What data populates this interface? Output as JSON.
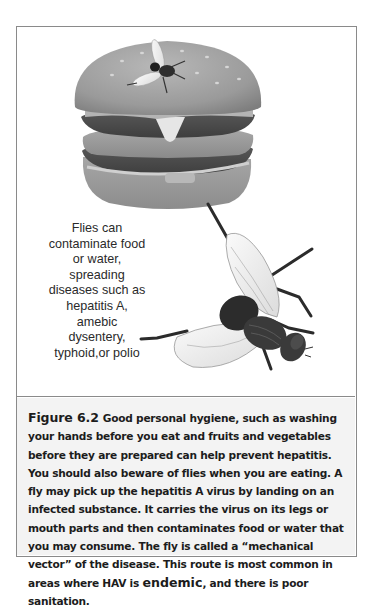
{
  "figure": {
    "label": "Figure 6.2",
    "illustration": {
      "subjects": [
        "hamburger-with-fly",
        "housefly"
      ],
      "side_note": "Flies can contaminate food or water, spreading diseases such as hepatitis A, amebic dysentery, typhoid,or polio"
    },
    "caption": {
      "part1": "Good personal hygiene, such as washing your hands before you eat and fruits and vegetables before they are prepared can help prevent hepatitis. You should also beware of flies when you are eating. A fly may pick up the hepatitis A virus by landing on an infected substance. It carries the virus on its legs or mouth parts and then contaminates food or water that you may consume. The fly is called a “mechanical vector” of the disease. This route is most common in areas where HAV is ",
      "term": "endemic",
      "part2": ", and there is poor sanitation."
    }
  },
  "colors": {
    "frame_border": "#8a8a8a",
    "caption_background": "#f3f3f3",
    "text": "#1c1c1c"
  }
}
